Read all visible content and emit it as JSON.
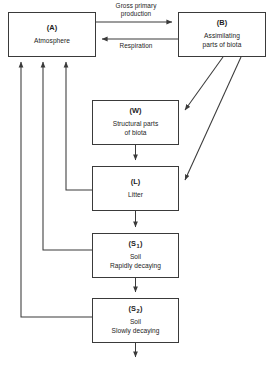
{
  "diagram": {
    "background_color": "#ffffff",
    "line_color": "#3a3a3a",
    "text_color": "#1c1c1c",
    "nodes": [
      {
        "id": "A",
        "code": "(A)",
        "code_text": "(A)",
        "subscript": "",
        "name": "Atmosphere"
      },
      {
        "id": "B",
        "code": "(B)",
        "code_text": "(B)",
        "subscript": "",
        "name": "Assimilating\nparts of biota"
      },
      {
        "id": "W",
        "code": "(W)",
        "code_text": "(W)",
        "subscript": "",
        "name": "Structural parts\nof biota"
      },
      {
        "id": "L",
        "code": "(L)",
        "code_text": "(L)",
        "subscript": "",
        "name": "Litter"
      },
      {
        "id": "S1",
        "code": "(S1)",
        "code_text": "(S",
        "subscript": "1",
        "name": "Soil\nRapidly decaying"
      },
      {
        "id": "S2",
        "code": "(S2)",
        "code_text": "(S",
        "subscript": "2",
        "name": "Soil\nSlowly decaying"
      }
    ],
    "edge_labels": {
      "gross_primary_production": "Gross primary\nproduction",
      "respiration": "Respiration"
    },
    "edges": [
      {
        "from": "A",
        "to": "B",
        "label": "Gross primary production"
      },
      {
        "from": "B",
        "to": "A",
        "label": "Respiration"
      },
      {
        "from": "B",
        "to": "W",
        "label": ""
      },
      {
        "from": "B",
        "to": "L",
        "label": ""
      },
      {
        "from": "W",
        "to": "L",
        "label": ""
      },
      {
        "from": "L",
        "to": "S1",
        "label": ""
      },
      {
        "from": "S1",
        "to": "S2",
        "label": ""
      },
      {
        "from": "L",
        "to": "A",
        "label": ""
      },
      {
        "from": "S1",
        "to": "A",
        "label": ""
      },
      {
        "from": "S2",
        "to": "A",
        "label": ""
      },
      {
        "from": "S2",
        "to": "",
        "label": ""
      }
    ]
  }
}
